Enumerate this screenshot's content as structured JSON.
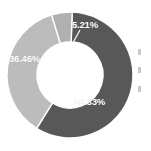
{
  "chart_data": {
    "type": "pie",
    "variant": "donut",
    "title": "",
    "subtitle": "",
    "xlabel": "",
    "ylabel": "",
    "grid": false,
    "legend_position": "right",
    "legend_truncated": true,
    "units": "percent",
    "label_format": "0.00%",
    "start_angle_deg": -90,
    "direction": "clockwise",
    "inner_radius_ratio": 0.52,
    "categories": [
      "Segment 1",
      "Segment 2",
      "Segment 3"
    ],
    "values": [
      58.33,
      36.46,
      5.21
    ],
    "labels": [
      "58.33%",
      "36.46%",
      "5.21%"
    ],
    "colors": [
      "#585858",
      "#bcbcbc",
      "#b0b0b0"
    ],
    "slices": [
      {
        "label": "58.33%",
        "value": 58.33,
        "color": "#585858",
        "start_deg": -88,
        "end_deg": 122,
        "label_x": 74,
        "label_y": 97,
        "has_leader_line": false
      },
      {
        "label": "36.46%",
        "value": 36.46,
        "color": "#bcbcbc",
        "start_deg": 122,
        "end_deg": 253,
        "label_x": 9,
        "label_y": 54,
        "has_leader_line": false
      },
      {
        "label": "5.21%",
        "value": 5.21,
        "color": "#b0b0b0",
        "start_deg": 253,
        "end_deg": 272,
        "label_x": 72,
        "label_y": 20,
        "has_leader_line": true
      }
    ]
  },
  "geometry": {
    "center_x": 70,
    "center_y": 75,
    "outer_radius": 63,
    "inner_radius": 33,
    "separator_color": "#ffffff",
    "separator_width": 1.4,
    "background": "#ffffff"
  },
  "leader_line": {
    "color": "#ffffff",
    "width": 1.2,
    "x1": 80,
    "y1": 30,
    "x2": 70,
    "y2": 48
  },
  "legend": {
    "truncated": true,
    "rows": [
      {
        "swatch_color": "#c9c9c9",
        "text": ""
      },
      {
        "swatch_color": "#c9c9c9",
        "text": ""
      },
      {
        "swatch_color": "#c9c9c9",
        "text": ""
      }
    ]
  }
}
